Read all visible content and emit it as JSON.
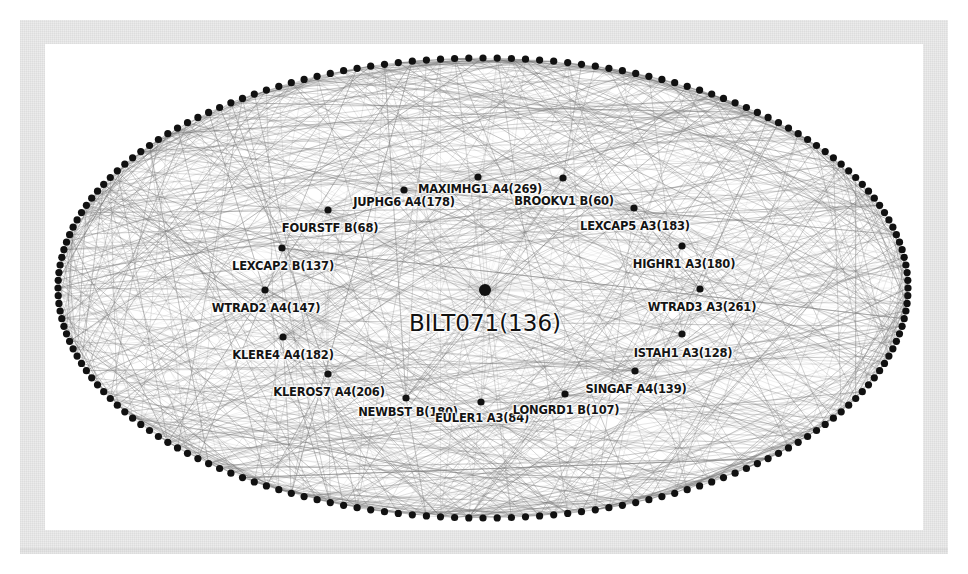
{
  "figure": {
    "type": "network-graph",
    "layout": "elliptical-ring-with-radial-hub",
    "background_color": "#ffffff",
    "frame_color": "#ececec",
    "node_color": "#111111",
    "edge_color": "#7a7a7a"
  },
  "ellipse": {
    "center_x": 483,
    "center_y": 288,
    "radius_x": 425,
    "radius_y": 230,
    "perimeter_node_count": 188,
    "perimeter_node_radius": 3.6
  },
  "hub": {
    "label": "BILT071(136)",
    "name": "BILT071",
    "value": 136,
    "x": 485,
    "y": 290,
    "label_x": 485,
    "label_y": 310,
    "node_radius": 6
  },
  "nodes": [
    {
      "label": "JUPHG6 A4(178)",
      "name": "JUPHG6",
      "group": "A4",
      "value": 178,
      "x": 404,
      "y": 190,
      "label_x": 404,
      "label_y": 195
    },
    {
      "label": "MAXIMHG1 A4(269)",
      "name": "MAXIMHG1",
      "group": "A4",
      "value": 269,
      "x": 478,
      "y": 177,
      "label_x": 480,
      "label_y": 182
    },
    {
      "label": "BROOKV1 B(60)",
      "name": "BROOKV1",
      "group": "B",
      "value": 60,
      "x": 563,
      "y": 178,
      "label_x": 564,
      "label_y": 194
    },
    {
      "label": "FOURSTF B(68)",
      "name": "FOURSTF",
      "group": "B",
      "value": 68,
      "x": 328,
      "y": 210,
      "label_x": 330,
      "label_y": 221
    },
    {
      "label": "LEXCAP5 A3(183)",
      "name": "LEXCAP5",
      "group": "A3",
      "value": 183,
      "x": 634,
      "y": 208,
      "label_x": 635,
      "label_y": 219
    },
    {
      "label": "LEXCAP2 B(137)",
      "name": "LEXCAP2",
      "group": "B",
      "value": 137,
      "x": 282,
      "y": 248,
      "label_x": 283,
      "label_y": 259
    },
    {
      "label": "HIGHR1 A3(180)",
      "name": "HIGHR1",
      "group": "A3",
      "value": 180,
      "x": 682,
      "y": 246,
      "label_x": 684,
      "label_y": 257
    },
    {
      "label": "WTRAD2 A4(147)",
      "name": "WTRAD2",
      "group": "A4",
      "value": 147,
      "x": 265,
      "y": 290,
      "label_x": 266,
      "label_y": 301
    },
    {
      "label": "WTRAD3 A3(261)",
      "name": "WTRAD3",
      "group": "A3",
      "value": 261,
      "x": 700,
      "y": 289,
      "label_x": 702,
      "label_y": 300
    },
    {
      "label": "KLERE4 A4(182)",
      "name": "KLERE4",
      "group": "A4",
      "value": 182,
      "x": 283,
      "y": 337,
      "label_x": 283,
      "label_y": 348
    },
    {
      "label": "ISTAH1 A3(128)",
      "name": "ISTAH1",
      "group": "A3",
      "value": 128,
      "x": 682,
      "y": 334,
      "label_x": 683,
      "label_y": 346
    },
    {
      "label": "KLEROS7 A4(206)",
      "name": "KLEROS7",
      "group": "A4",
      "value": 206,
      "x": 328,
      "y": 374,
      "label_x": 329,
      "label_y": 385
    },
    {
      "label": "SINGAF A4(139)",
      "name": "SINGAF",
      "group": "A4",
      "value": 139,
      "x": 635,
      "y": 371,
      "label_x": 636,
      "label_y": 382
    },
    {
      "label": "NEWBST B(180)",
      "name": "NEWBST",
      "group": "B",
      "value": 180,
      "x": 406,
      "y": 398,
      "label_x": 408,
      "label_y": 405
    },
    {
      "label": "EULER1 A3(84)",
      "name": "EULER1",
      "group": "A3",
      "value": 84,
      "x": 481,
      "y": 402,
      "label_x": 482,
      "label_y": 411
    },
    {
      "label": "LONGRD1 B(107)",
      "name": "LONGRD1",
      "group": "B",
      "value": 107,
      "x": 565,
      "y": 394,
      "label_x": 566,
      "label_y": 403
    }
  ]
}
